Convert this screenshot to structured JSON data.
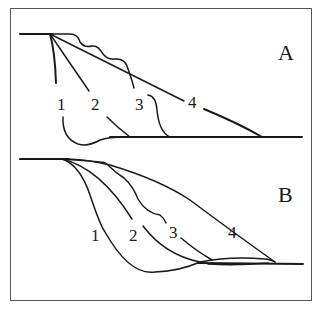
{
  "figure": {
    "panels": [
      {
        "id": "A",
        "label": "A",
        "curve_labels": [
          "1",
          "2",
          "3",
          "4"
        ]
      },
      {
        "id": "B",
        "label": "B",
        "curve_labels": [
          "1",
          "2",
          "3",
          "4"
        ]
      }
    ],
    "colors": {
      "stroke": "#1a1a1a",
      "frame": "#555555",
      "background": "#ffffff"
    },
    "caption": ""
  }
}
